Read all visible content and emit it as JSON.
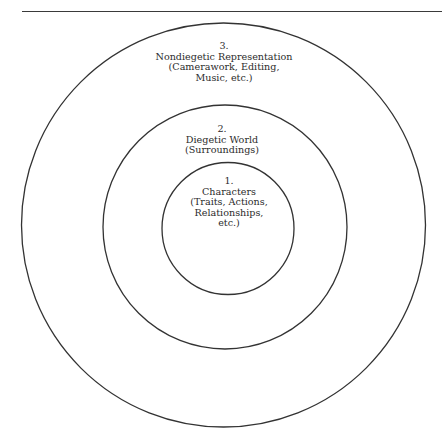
{
  "header": {
    "running_head": "",
    "page_number": ""
  },
  "diagram": {
    "type": "concentric-circles",
    "stroke_color": "#333333",
    "rings": [
      {
        "level": 1,
        "number": "1.",
        "title": "Characters",
        "detail_lines": [
          "(Traits, Actions,",
          "Relationships,",
          "etc.)"
        ]
      },
      {
        "level": 2,
        "number": "2.",
        "title": "Diegetic World",
        "detail_lines": [
          "(Surroundings)"
        ]
      },
      {
        "level": 3,
        "number": "3.",
        "title": "Nondiegetic Representation",
        "detail_lines": [
          "(Camerawork, Editing,",
          "Music, etc.)"
        ]
      }
    ]
  }
}
